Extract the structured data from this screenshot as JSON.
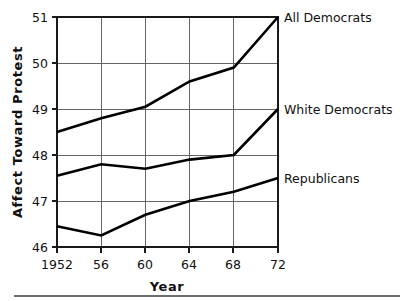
{
  "chart_data": {
    "type": "line",
    "title": "",
    "subtitle": "",
    "xlabel": "Year",
    "ylabel": "Affect Toward Protest",
    "x": [
      1952,
      1956,
      1960,
      1964,
      1968,
      1972
    ],
    "xtick_labels": [
      "1952",
      "56",
      "60",
      "64",
      "68",
      "72"
    ],
    "ytick_labels": [
      "46",
      "47",
      "48",
      "49",
      "50",
      "51"
    ],
    "yticks": [
      46,
      47,
      48,
      49,
      50,
      51
    ],
    "xlim": [
      1952,
      1972
    ],
    "ylim": [
      46,
      51
    ],
    "grid": true,
    "legend_position": "right-inline-annotations",
    "series": [
      {
        "name": "All Democrats",
        "label": "All Democrats",
        "color": "#000000",
        "values": [
          48.5,
          48.8,
          49.05,
          49.6,
          49.9,
          51.0
        ]
      },
      {
        "name": "White Democrats",
        "label": "White Democrats",
        "color": "#000000",
        "values": [
          47.55,
          47.8,
          47.7,
          47.9,
          48.0,
          49.0
        ]
      },
      {
        "name": "Republicans",
        "label": "Republicans",
        "color": "#000000",
        "values": [
          46.45,
          46.25,
          46.7,
          47.0,
          47.2,
          47.5
        ]
      }
    ],
    "annotations": [
      {
        "text": "All Democrats",
        "at_year": 1972,
        "at_value": 51.0
      },
      {
        "text": "White Democrats",
        "at_year": 1972,
        "at_value": 49.0
      },
      {
        "text": "Republicans",
        "at_year": 1972,
        "at_value": 47.5
      }
    ]
  },
  "axes": {
    "y_title": "Affect Toward Protest",
    "x_title": "Year",
    "y_tick_0": "46",
    "y_tick_1": "47",
    "y_tick_2": "48",
    "y_tick_3": "49",
    "y_tick_4": "50",
    "y_tick_5": "51",
    "x_tick_0": "1952",
    "x_tick_1": "56",
    "x_tick_2": "60",
    "x_tick_3": "64",
    "x_tick_4": "68",
    "x_tick_5": "72"
  },
  "labels": {
    "all_democrats": "All Democrats",
    "white_democrats": "White Democrats",
    "republicans": "Republicans"
  },
  "colors": {
    "line": "#000000",
    "grid": "#555555",
    "frame": "#1a1a1a",
    "background": "#ffffff"
  }
}
